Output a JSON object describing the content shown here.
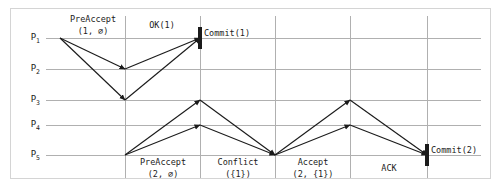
{
  "diagram": {
    "colors": {
      "grid": "#b0b0b0",
      "frame": "#d4d4d4",
      "arrow": "#1b1b1b",
      "background": "#ffffff"
    },
    "replicas": [
      {
        "id": "P1",
        "name": "P",
        "sub": "1",
        "y": 38
      },
      {
        "id": "P2",
        "name": "P",
        "sub": "2",
        "y": 69
      },
      {
        "id": "P3",
        "name": "P",
        "sub": "3",
        "y": 100
      },
      {
        "id": "P4",
        "name": "P",
        "sub": "4",
        "y": 125
      },
      {
        "id": "P5",
        "name": "P",
        "sub": "5",
        "y": 155
      }
    ],
    "time_gridlines": [
      125,
      200,
      275,
      350,
      427
    ],
    "labels": [
      {
        "name": "preaccept-1-label",
        "line1": "PreAccept",
        "line2": "(1, ∅)",
        "x": 93,
        "y": 14,
        "align": "center"
      },
      {
        "name": "ok-1-label",
        "line1": "OK(1)",
        "line2": "",
        "x": 162,
        "y": 20,
        "align": "center"
      },
      {
        "name": "commit-1-label",
        "line1": "Commit(1)",
        "line2": "",
        "x": 204,
        "y": 28,
        "align": "left"
      },
      {
        "name": "preaccept-2-label",
        "line1": "PreAccept",
        "line2": "(2, ∅)",
        "x": 163,
        "y": 157,
        "align": "center"
      },
      {
        "name": "conflict-label",
        "line1": "Conflict",
        "line2": "({1})",
        "x": 238,
        "y": 157,
        "align": "center"
      },
      {
        "name": "accept-2-label",
        "line1": "Accept",
        "line2": "(2, {1})",
        "x": 313,
        "y": 157,
        "align": "center"
      },
      {
        "name": "ack-label",
        "line1": "ACK",
        "line2": "",
        "x": 389,
        "y": 163,
        "align": "center"
      },
      {
        "name": "commit-2-label",
        "line1": "Commit(2)",
        "line2": "",
        "x": 431,
        "y": 145,
        "align": "left"
      }
    ],
    "arrows": [
      {
        "name": "arrow-preaccept-p1-p2",
        "x1": 60,
        "y1": 38,
        "x2": 125,
        "y2": 69
      },
      {
        "name": "arrow-preaccept-p1-p3",
        "x1": 60,
        "y1": 38,
        "x2": 125,
        "y2": 100
      },
      {
        "name": "arrow-ok-p2-p1",
        "x1": 125,
        "y1": 69,
        "x2": 200,
        "y2": 38
      },
      {
        "name": "arrow-ok-p3-p1",
        "x1": 125,
        "y1": 100,
        "x2": 200,
        "y2": 38
      },
      {
        "name": "arrow-preaccept-p5-p3",
        "x1": 125,
        "y1": 155,
        "x2": 200,
        "y2": 100
      },
      {
        "name": "arrow-preaccept-p5-p4",
        "x1": 125,
        "y1": 155,
        "x2": 200,
        "y2": 125
      },
      {
        "name": "arrow-conflict-p3-p5",
        "x1": 200,
        "y1": 100,
        "x2": 275,
        "y2": 155
      },
      {
        "name": "arrow-conflict-p4-p5",
        "x1": 200,
        "y1": 125,
        "x2": 275,
        "y2": 155
      },
      {
        "name": "arrow-accept-p5-p3",
        "x1": 275,
        "y1": 155,
        "x2": 350,
        "y2": 100
      },
      {
        "name": "arrow-accept-p5-p4",
        "x1": 275,
        "y1": 155,
        "x2": 350,
        "y2": 125
      },
      {
        "name": "arrow-ack-p3-p5",
        "x1": 350,
        "y1": 100,
        "x2": 427,
        "y2": 155
      },
      {
        "name": "arrow-ack-p4-p5",
        "x1": 350,
        "y1": 125,
        "x2": 427,
        "y2": 155
      }
    ],
    "commit_marks": [
      {
        "name": "commit-mark-1",
        "x": 200,
        "y": 38
      },
      {
        "name": "commit-mark-2",
        "x": 427,
        "y": 155
      }
    ]
  }
}
